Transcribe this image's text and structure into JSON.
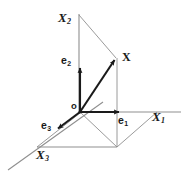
{
  "figure": {
    "type": "vector-diagram",
    "title": "",
    "dimensions": {
      "width": 185,
      "height": 175
    },
    "colors": {
      "background": "#ffffff",
      "axis": "#8c8c8c",
      "construction": "#8c8c8c",
      "vector": "#1a1a1a",
      "label": "#1a1a1a"
    },
    "labels": {
      "axis_x1": {
        "base": "X",
        "sub": "1"
      },
      "axis_x2": {
        "base": "X",
        "sub": "2"
      },
      "axis_x3": {
        "base": "X",
        "sub": "3"
      },
      "basis_e1": {
        "base": "e",
        "sub": "1"
      },
      "basis_e2": {
        "base": "e",
        "sub": "2"
      },
      "basis_e3": {
        "base": "e",
        "sub": "3"
      },
      "vector_x": {
        "base": "X",
        "sub": ""
      },
      "origin": {
        "base": "o",
        "sub": ""
      }
    },
    "geometry": {
      "origin": {
        "x": 80,
        "y": 112
      },
      "vector_tip": {
        "x": 116,
        "y": 58
      },
      "e1_tip": {
        "x": 121,
        "y": 112
      },
      "e2_tip": {
        "x": 80,
        "y": 66
      },
      "e3_tip": {
        "x": 56,
        "y": 130
      },
      "foot_point": {
        "x": 117,
        "y": 147
      },
      "x2_axis_top": {
        "x": 79,
        "y": 14
      },
      "x1_axis_end": {
        "x": 181,
        "y": 112
      },
      "x3_axis_end": {
        "x": 8,
        "y": 170
      }
    }
  }
}
